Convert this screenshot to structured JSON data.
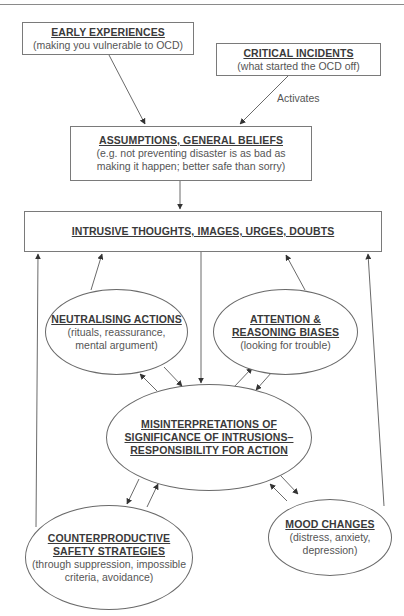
{
  "diagram": {
    "colors": {
      "line": "#6a6a6a",
      "text": "#333333",
      "subtext": "#555555",
      "background": "#ffffff"
    },
    "nodes": {
      "early_experiences": {
        "title": "EARLY EXPERIENCES",
        "subtitle": "(making you vulnerable to OCD)",
        "shape": "rectangle"
      },
      "critical_incidents": {
        "title": "CRITICAL INCIDENTS",
        "subtitle": "(what started the OCD off)",
        "shape": "rectangle"
      },
      "assumptions": {
        "title": "ASSUMPTIONS, GENERAL BELIEFS",
        "subtitle_line1": "(e.g. not preventing disaster is as bad as",
        "subtitle_line2": "making it happen; better safe than sorry)",
        "shape": "rectangle"
      },
      "intrusive": {
        "title": "INTRUSIVE THOUGHTS, IMAGES, URGES, DOUBTS",
        "shape": "rectangle"
      },
      "neutralising": {
        "title": "NEUTRALISING ACTIONS",
        "subtitle_line1": "(rituals, reassurance,",
        "subtitle_line2": "mental argument)",
        "shape": "ellipse"
      },
      "attention": {
        "title_line1": "ATTENTION &",
        "title_line2": "REASONING BIASES",
        "subtitle": "(looking for trouble)",
        "shape": "ellipse"
      },
      "misinterpretations": {
        "title_line1": "MISINTERPRETATIONS OF",
        "title_line2": "SIGNIFICANCE OF INTRUSIONS–",
        "title_line3": "RESPONSIBILITY FOR ACTION",
        "shape": "ellipse"
      },
      "counterproductive": {
        "title_line1": "COUNTERPRODUCTIVE",
        "title_line2": "SAFETY STRATEGIES",
        "subtitle_line1": "(through suppression, impossible",
        "subtitle_line2": "criteria, avoidance)",
        "shape": "ellipse"
      },
      "mood": {
        "title": "MOOD CHANGES",
        "subtitle_line1": "(distress, anxiety,",
        "subtitle_line2": "depression)",
        "shape": "ellipse"
      }
    },
    "edge_labels": {
      "activates": "Activates"
    },
    "edges": [
      {
        "from": "early_experiences",
        "to": "assumptions"
      },
      {
        "from": "critical_incidents",
        "to": "assumptions",
        "label": "Activates"
      },
      {
        "from": "assumptions",
        "to": "intrusive"
      },
      {
        "from": "intrusive",
        "to": "misinterpretations"
      },
      {
        "from": "neutralising",
        "to": "intrusive"
      },
      {
        "from": "attention",
        "to": "intrusive"
      },
      {
        "from": "counterproductive",
        "to": "intrusive"
      },
      {
        "from": "mood",
        "to": "intrusive"
      },
      {
        "from": "misinterpretations",
        "to": "neutralising"
      },
      {
        "from": "neutralising",
        "to": "misinterpretations"
      },
      {
        "from": "misinterpretations",
        "to": "attention"
      },
      {
        "from": "attention",
        "to": "misinterpretations"
      },
      {
        "from": "misinterpretations",
        "to": "counterproductive"
      },
      {
        "from": "counterproductive",
        "to": "misinterpretations"
      },
      {
        "from": "misinterpretations",
        "to": "mood"
      },
      {
        "from": "mood",
        "to": "misinterpretations"
      }
    ]
  }
}
